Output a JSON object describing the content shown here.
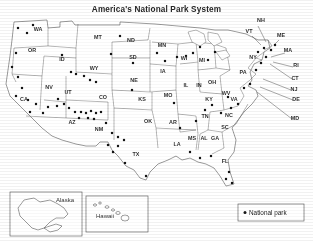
{
  "title": "America's National Park System",
  "legend": {
    "label": "National park",
    "marker": "dot"
  },
  "insets": [
    {
      "name": "Alaska",
      "label": "Alaska"
    },
    {
      "name": "Hawaii",
      "label": "Hawaii"
    }
  ],
  "states": [
    {
      "abbr": "WA",
      "x": 38,
      "y": 31
    },
    {
      "abbr": "OR",
      "x": 32,
      "y": 52
    },
    {
      "abbr": "CA",
      "x": 24,
      "y": 101
    },
    {
      "abbr": "NV",
      "x": 49,
      "y": 89
    },
    {
      "abbr": "ID",
      "x": 62,
      "y": 61
    },
    {
      "abbr": "MT",
      "x": 98,
      "y": 39
    },
    {
      "abbr": "WY",
      "x": 94,
      "y": 70
    },
    {
      "abbr": "UT",
      "x": 68,
      "y": 94
    },
    {
      "abbr": "AZ",
      "x": 72,
      "y": 124
    },
    {
      "abbr": "NM",
      "x": 99,
      "y": 131
    },
    {
      "abbr": "CO",
      "x": 103,
      "y": 99
    },
    {
      "abbr": "ND",
      "x": 131,
      "y": 42
    },
    {
      "abbr": "SD",
      "x": 133,
      "y": 59
    },
    {
      "abbr": "NE",
      "x": 134,
      "y": 82
    },
    {
      "abbr": "KS",
      "x": 142,
      "y": 101
    },
    {
      "abbr": "OK",
      "x": 148,
      "y": 123
    },
    {
      "abbr": "TX",
      "x": 136,
      "y": 156
    },
    {
      "abbr": "MN",
      "x": 162,
      "y": 47
    },
    {
      "abbr": "IA",
      "x": 163,
      "y": 73
    },
    {
      "abbr": "MO",
      "x": 168,
      "y": 97
    },
    {
      "abbr": "AR",
      "x": 173,
      "y": 124
    },
    {
      "abbr": "LA",
      "x": 177,
      "y": 146
    },
    {
      "abbr": "WI",
      "x": 184,
      "y": 60
    },
    {
      "abbr": "IL",
      "x": 186,
      "y": 87
    },
    {
      "abbr": "MS",
      "x": 192,
      "y": 140
    },
    {
      "abbr": "MI",
      "x": 202,
      "y": 62
    },
    {
      "abbr": "IN",
      "x": 199,
      "y": 87
    },
    {
      "abbr": "AL",
      "x": 204,
      "y": 140
    },
    {
      "abbr": "OH",
      "x": 212,
      "y": 84
    },
    {
      "abbr": "KY",
      "x": 209,
      "y": 101
    },
    {
      "abbr": "TN",
      "x": 205,
      "y": 118
    },
    {
      "abbr": "GA",
      "x": 215,
      "y": 140
    },
    {
      "abbr": "FL",
      "x": 225,
      "y": 163
    },
    {
      "abbr": "SC",
      "x": 225,
      "y": 129
    },
    {
      "abbr": "NC",
      "x": 229,
      "y": 117
    },
    {
      "abbr": "WV",
      "x": 226,
      "y": 95
    },
    {
      "abbr": "VA",
      "x": 234,
      "y": 101
    },
    {
      "abbr": "PA",
      "x": 243,
      "y": 74
    },
    {
      "abbr": "NY",
      "x": 253,
      "y": 59
    },
    {
      "abbr": "VT",
      "x": 249,
      "y": 33
    },
    {
      "abbr": "NH",
      "x": 261,
      "y": 22
    },
    {
      "abbr": "ME",
      "x": 281,
      "y": 37
    },
    {
      "abbr": "MA",
      "x": 288,
      "y": 52
    },
    {
      "abbr": "RI",
      "x": 296,
      "y": 67
    },
    {
      "abbr": "CT",
      "x": 295,
      "y": 80
    },
    {
      "abbr": "NJ",
      "x": 294,
      "y": 91
    },
    {
      "abbr": "DE",
      "x": 296,
      "y": 101
    },
    {
      "abbr": "MD",
      "x": 295,
      "y": 120
    }
  ],
  "leaders": [
    {
      "state": "NH",
      "x1": 258,
      "y1": 26,
      "x2": 266,
      "y2": 42
    },
    {
      "state": "VT",
      "x1": 252,
      "y1": 36,
      "x2": 261,
      "y2": 45
    },
    {
      "state": "ME",
      "x1": 279,
      "y1": 40,
      "x2": 274,
      "y2": 45
    },
    {
      "state": "MA",
      "x1": 285,
      "y1": 53,
      "x2": 271,
      "y2": 57
    },
    {
      "state": "RI",
      "x1": 293,
      "y1": 67,
      "x2": 273,
      "y2": 62
    },
    {
      "state": "CT",
      "x1": 292,
      "y1": 79,
      "x2": 270,
      "y2": 64
    },
    {
      "state": "NJ",
      "x1": 291,
      "y1": 90,
      "x2": 263,
      "y2": 79
    },
    {
      "state": "DE",
      "x1": 293,
      "y1": 100,
      "x2": 260,
      "y2": 87
    },
    {
      "state": "MD",
      "x1": 292,
      "y1": 119,
      "x2": 257,
      "y2": 92
    }
  ],
  "parks": [
    {
      "x": 18,
      "y": 28
    },
    {
      "x": 27,
      "y": 33
    },
    {
      "x": 33,
      "y": 25
    },
    {
      "x": 16,
      "y": 53
    },
    {
      "x": 12,
      "y": 67
    },
    {
      "x": 18,
      "y": 77
    },
    {
      "x": 22,
      "y": 88
    },
    {
      "x": 16,
      "y": 96
    },
    {
      "x": 28,
      "y": 100
    },
    {
      "x": 36,
      "y": 104
    },
    {
      "x": 30,
      "y": 112
    },
    {
      "x": 43,
      "y": 113
    },
    {
      "x": 48,
      "y": 107
    },
    {
      "x": 57,
      "y": 106
    },
    {
      "x": 64,
      "y": 104
    },
    {
      "x": 58,
      "y": 99
    },
    {
      "x": 69,
      "y": 108
    },
    {
      "x": 75,
      "y": 112
    },
    {
      "x": 81,
      "y": 112
    },
    {
      "x": 86,
      "y": 113
    },
    {
      "x": 91,
      "y": 111
    },
    {
      "x": 96,
      "y": 113
    },
    {
      "x": 101,
      "y": 112
    },
    {
      "x": 79,
      "y": 118
    },
    {
      "x": 88,
      "y": 118
    },
    {
      "x": 94,
      "y": 119
    },
    {
      "x": 106,
      "y": 123
    },
    {
      "x": 112,
      "y": 133
    },
    {
      "x": 118,
      "y": 137
    },
    {
      "x": 124,
      "y": 140
    },
    {
      "x": 108,
      "y": 145
    },
    {
      "x": 113,
      "y": 152
    },
    {
      "x": 118,
      "y": 146
    },
    {
      "x": 125,
      "y": 163
    },
    {
      "x": 146,
      "y": 176
    },
    {
      "x": 62,
      "y": 55
    },
    {
      "x": 71,
      "y": 72
    },
    {
      "x": 76,
      "y": 74
    },
    {
      "x": 84,
      "y": 76
    },
    {
      "x": 90,
      "y": 80
    },
    {
      "x": 96,
      "y": 82
    },
    {
      "x": 111,
      "y": 54
    },
    {
      "x": 120,
      "y": 36
    },
    {
      "x": 133,
      "y": 63
    },
    {
      "x": 132,
      "y": 90
    },
    {
      "x": 157,
      "y": 53
    },
    {
      "x": 165,
      "y": 61
    },
    {
      "x": 177,
      "y": 57
    },
    {
      "x": 186,
      "y": 56
    },
    {
      "x": 193,
      "y": 53
    },
    {
      "x": 200,
      "y": 47
    },
    {
      "x": 208,
      "y": 60
    },
    {
      "x": 215,
      "y": 52
    },
    {
      "x": 174,
      "y": 103
    },
    {
      "x": 180,
      "y": 128
    },
    {
      "x": 196,
      "y": 121
    },
    {
      "x": 205,
      "y": 110
    },
    {
      "x": 212,
      "y": 105
    },
    {
      "x": 221,
      "y": 113
    },
    {
      "x": 231,
      "y": 108
    },
    {
      "x": 238,
      "y": 104
    },
    {
      "x": 228,
      "y": 97
    },
    {
      "x": 244,
      "y": 88
    },
    {
      "x": 250,
      "y": 84
    },
    {
      "x": 256,
      "y": 70
    },
    {
      "x": 261,
      "y": 63
    },
    {
      "x": 266,
      "y": 57
    },
    {
      "x": 271,
      "y": 50
    },
    {
      "x": 275,
      "y": 45
    },
    {
      "x": 264,
      "y": 48
    },
    {
      "x": 258,
      "y": 52
    },
    {
      "x": 190,
      "y": 152
    },
    {
      "x": 200,
      "y": 158
    },
    {
      "x": 211,
      "y": 156
    },
    {
      "x": 229,
      "y": 172
    },
    {
      "x": 232,
      "y": 183
    },
    {
      "x": 226,
      "y": 179
    }
  ],
  "alaska_parks": [
    {
      "x": 30,
      "y": 206
    },
    {
      "x": 41,
      "y": 211
    },
    {
      "x": 37,
      "y": 216
    },
    {
      "x": 33,
      "y": 224
    },
    {
      "x": 52,
      "y": 226
    }
  ],
  "hawaii_parks": [
    {
      "x": 100,
      "y": 216
    }
  ]
}
